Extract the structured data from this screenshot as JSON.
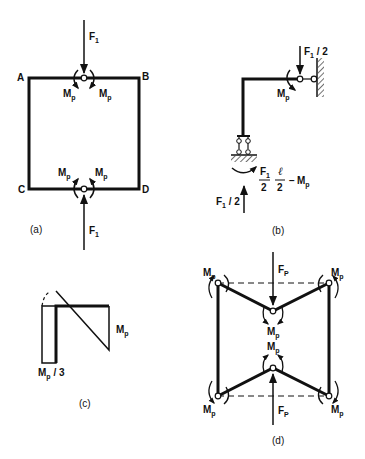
{
  "figure": {
    "panels": [
      {
        "id": "a",
        "caption": "(a)",
        "nodes": {
          "A": "A",
          "B": "B",
          "C": "C",
          "D": "D"
        },
        "loads": {
          "top": "F",
          "top_sub": "1",
          "bottom": "F",
          "bottom_sub": "1"
        },
        "moments": {
          "label": "M",
          "sub": "p"
        }
      },
      {
        "id": "b",
        "caption": "(b)",
        "load_top": {
          "base": "F",
          "sub": "1",
          "suffix": " / 2"
        },
        "moment": {
          "label": "M",
          "sub": "p"
        },
        "reaction": {
          "base": "F",
          "sub": "1",
          "suffix": " / 2"
        },
        "base_moment": {
          "frac1_num": "F",
          "frac1_num_sub": "1",
          "frac1_den": "2",
          "frac2_num": "ℓ",
          "frac2_den": "2",
          "minus": "−",
          "term": "M",
          "term_sub": "p"
        }
      },
      {
        "id": "c",
        "caption": "(c)",
        "label_right": {
          "base": "M",
          "sub": "p"
        },
        "label_bottom": {
          "base": "M",
          "sub": "p",
          "suffix": " / 3"
        }
      },
      {
        "id": "d",
        "caption": "(d)",
        "load_top": {
          "base": "F",
          "sub": "P"
        },
        "load_bottom": {
          "base": "F",
          "sub": "P"
        },
        "moment": {
          "base": "M",
          "sub": "p"
        }
      }
    ],
    "colors": {
      "ink": "#111111",
      "background": "#ffffff"
    }
  }
}
